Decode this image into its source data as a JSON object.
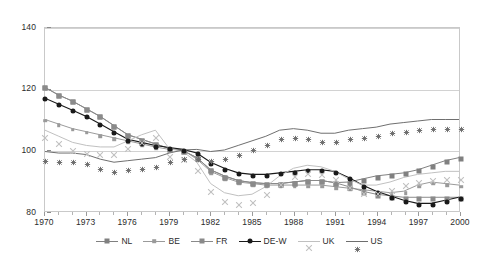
{
  "chart_data": {
    "type": "line",
    "title": "",
    "xlabel": "",
    "ylabel": "",
    "xlim": [
      1970,
      2000
    ],
    "ylim": [
      80,
      140
    ],
    "grid": true,
    "legend_position": "bottom",
    "x": [
      1970,
      1971,
      1972,
      1973,
      1974,
      1975,
      1976,
      1977,
      1978,
      1979,
      1980,
      1981,
      1982,
      1983,
      1984,
      1985,
      1986,
      1987,
      1988,
      1989,
      1990,
      1991,
      1992,
      1993,
      1994,
      1995,
      1996,
      1997,
      1998,
      1999,
      2000
    ],
    "yticks": [
      80,
      100,
      120,
      140
    ],
    "xticks": [
      1970,
      1973,
      1976,
      1979,
      1982,
      1985,
      1988,
      1991,
      1994,
      1997,
      2000
    ],
    "series": [
      {
        "name": "NL",
        "color": "#808080",
        "marker": "square",
        "values": [
          120.5,
          118.0,
          116.0,
          113.5,
          111.0,
          108.0,
          105.0,
          103.5,
          102.0,
          100.5,
          99.8,
          97.5,
          93.5,
          91.5,
          90.0,
          89.3,
          89.0,
          89.0,
          89.5,
          90.0,
          90.0,
          89.3,
          89.5,
          90.5,
          91.5,
          92.0,
          92.5,
          93.5,
          95.0,
          96.5,
          97.5
        ]
      },
      {
        "name": "BE",
        "color": "#9a9a9a",
        "marker": "square-small",
        "values": [
          110.0,
          108.5,
          107.0,
          106.0,
          105.0,
          104.0,
          103.0,
          102.0,
          101.0,
          100.2,
          100.0,
          97.0,
          93.0,
          91.0,
          89.5,
          89.0,
          88.5,
          88.5,
          88.5,
          88.5,
          88.5,
          88.0,
          87.5,
          87.0,
          86.5,
          86.0,
          86.5,
          88.5,
          89.5,
          89.0,
          88.5
        ]
      },
      {
        "name": "FR",
        "color": "#8a8a8a",
        "marker": "square",
        "values": [
          120.5,
          118.0,
          116.0,
          113.5,
          111.0,
          108.0,
          105.0,
          103.5,
          102.0,
          100.5,
          99.8,
          97.5,
          93.5,
          91.5,
          90.0,
          89.3,
          89.0,
          89.0,
          89.5,
          90.0,
          90.0,
          89.3,
          88.0,
          86.5,
          85.5,
          85.0,
          84.5,
          84.5,
          84.5,
          84.5,
          84.5
        ]
      },
      {
        "name": "DE-W",
        "color": "#1a1a1a",
        "marker": "circle",
        "values": [
          117.0,
          115.0,
          113.0,
          111.0,
          108.5,
          106.0,
          103.5,
          102.5,
          101.5,
          100.8,
          100.2,
          99.0,
          96.0,
          94.0,
          92.5,
          92.0,
          92.0,
          92.5,
          93.0,
          93.5,
          93.5,
          93.0,
          91.0,
          88.5,
          86.5,
          85.0,
          83.5,
          82.5,
          82.5,
          83.5,
          84.5
        ]
      },
      {
        "name": "UK",
        "color": "#c0c0c0",
        "marker": "x",
        "values": [
          106.5,
          104.5,
          102.5,
          101.5,
          101.0,
          101.0,
          103.0,
          105.0,
          106.5,
          100.5,
          99.5,
          96.0,
          89.0,
          86.0,
          85.0,
          85.5,
          88.0,
          91.5,
          94.0,
          95.0,
          94.5,
          93.0,
          90.5,
          88.5,
          88.5,
          89.5,
          91.0,
          92.0,
          92.5,
          93.0,
          93.0
        ]
      },
      {
        "name": "US",
        "color": "#6e6e6e",
        "marker": "star",
        "values": [
          99.5,
          99.0,
          99.0,
          98.5,
          97.0,
          96.0,
          96.5,
          97.0,
          97.5,
          99.0,
          100.0,
          100.2,
          99.5,
          100.0,
          101.5,
          103.0,
          104.5,
          106.5,
          107.0,
          106.5,
          105.5,
          105.5,
          106.5,
          107.0,
          107.5,
          108.5,
          109.0,
          109.5,
          110.0,
          110.0,
          110.0
        ]
      }
    ]
  },
  "legend": {
    "items": [
      {
        "label": "NL"
      },
      {
        "label": "BE"
      },
      {
        "label": "FR"
      },
      {
        "label": "DE-W"
      },
      {
        "label": "UK"
      },
      {
        "label": "US"
      }
    ]
  },
  "axes": {
    "y_labels": [
      "140",
      "120",
      "100",
      "80"
    ],
    "x_labels": [
      "1970",
      "1973",
      "1976",
      "1979",
      "1982",
      "1985",
      "1988",
      "1991",
      "1994",
      "1997",
      "2000"
    ]
  }
}
